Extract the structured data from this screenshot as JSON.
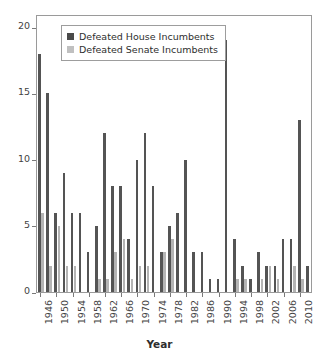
{
  "chart_data": {
    "type": "bar",
    "title": "",
    "subtitle": "",
    "xlabel": "Year",
    "ylabel": "",
    "ylim": [
      0,
      21
    ],
    "y_ticks": [
      0,
      5,
      10,
      15,
      20
    ],
    "grid": false,
    "legend_position": "top-left-inside",
    "categories": [
      1946,
      1948,
      1950,
      1952,
      1954,
      1956,
      1958,
      1960,
      1962,
      1964,
      1966,
      1968,
      1970,
      1972,
      1974,
      1976,
      1978,
      1980,
      1982,
      1984,
      1986,
      1988,
      1990,
      1992,
      1994,
      1996,
      1998,
      2000,
      2002,
      2004,
      2006,
      2008,
      2010,
      2012
    ],
    "x_tick_labels": [
      "1946",
      "1950",
      "1954",
      "1958",
      "1962",
      "1966",
      "1970",
      "1974",
      "1978",
      "1982",
      "1986",
      "1990",
      "1994",
      "1998",
      "2002",
      "2006",
      "2010"
    ],
    "series": [
      {
        "name": "Defeated House Incumbents",
        "color": "#545454",
        "values": [
          18,
          15,
          6,
          9,
          6,
          6,
          3,
          5,
          12,
          8,
          8,
          4,
          10,
          12,
          8,
          3,
          5,
          6,
          10,
          3,
          3,
          1,
          1,
          19,
          4,
          2,
          1,
          3,
          2,
          2,
          4,
          4,
          13,
          2
        ]
      },
      {
        "name": "Defeated Senate Incumbents",
        "color": "#b4b4b4",
        "values": [
          6,
          2,
          5,
          2,
          2,
          0,
          0,
          1,
          1,
          3,
          4,
          1,
          2,
          2,
          0,
          3,
          4,
          0,
          0,
          0,
          0,
          0,
          0,
          0,
          1,
          1,
          0,
          1,
          2,
          1,
          0,
          2,
          1,
          0
        ]
      }
    ]
  },
  "legend": {
    "items": [
      {
        "label": "Defeated House Incumbents",
        "swatch": "house-swatch"
      },
      {
        "label": "Defeated Senate Incumbents",
        "swatch": "senate-swatch"
      }
    ]
  },
  "axis": {
    "x_title": "Year"
  },
  "colors": {
    "house": "#545454",
    "senate": "#b4b4b4",
    "frame": "#9a9a9a",
    "text": "#434343",
    "background": "#ffffff"
  }
}
